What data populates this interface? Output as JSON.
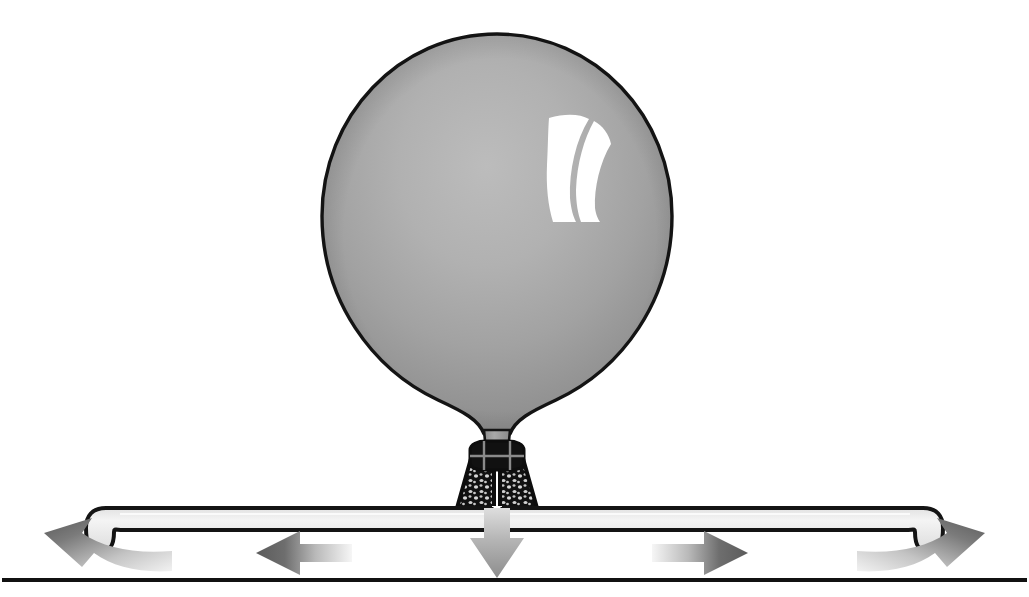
{
  "figure": {
    "title": "Inflated balloon tied to a flexible bar with force arrows",
    "domain_kind": "scientific-illustration",
    "canvas": {
      "width": 1029,
      "height": 597
    },
    "background_color": "#ffffff"
  },
  "balloon": {
    "label": "balloon",
    "center_x": 497,
    "center_y": 215,
    "radius_x": 175,
    "radius_y": 182,
    "top_y": 34,
    "bottom_y": 430,
    "left_x": 322,
    "right_x": 672,
    "fill_light": "#b4b4b4",
    "fill_mid": "#9a9a9a",
    "fill_dark": "#7d7d7d",
    "outline_color": "#141414",
    "outline_width": 3,
    "highlight_color": "#ffffff"
  },
  "highlight": {
    "label": "specular-highlight",
    "description": "two white crescent streaks on upper right of balloon",
    "center_x": 572,
    "center_y": 168,
    "color": "#ffffff"
  },
  "neck": {
    "label": "balloon-neck",
    "top_y": 400,
    "bottom_y": 440,
    "width": 26,
    "fill": "#9a9a9a"
  },
  "knot": {
    "label": "tied-knot",
    "description": "dark stippled knot clamping the balloon neck to the bar",
    "top_y": 448,
    "bottom_y": 510,
    "top_width": 48,
    "bottom_width": 78,
    "color": "#111111",
    "speckle_color": "#d8d8d8"
  },
  "bar": {
    "label": "flexible-bar",
    "left_x": 88,
    "right_x": 941,
    "top_y": 508,
    "bottom_y": 530,
    "thickness": 22,
    "end_drop": 32,
    "fill": "#ededed",
    "outline_color": "#141414",
    "outline_width": 4
  },
  "ground": {
    "label": "ground-line",
    "y": 580,
    "left_x": 4,
    "right_x": 1025,
    "color": "#111111",
    "thickness": 4
  },
  "arrows": [
    {
      "id": "left-curved-arrow",
      "name": "left-reaction-arrow",
      "kind": "curved",
      "direction": "up-left",
      "tip_x": 44,
      "tip_y": 540,
      "tail_x": 170,
      "tail_y": 568,
      "color_head": "#5e5e5e",
      "color_tail": "#e8e8e8"
    },
    {
      "id": "left-straight-arrow",
      "name": "left-force-arrow",
      "kind": "straight",
      "direction": "left",
      "tip_x": 256,
      "tip_y": 553,
      "tail_x": 350,
      "tail_y": 553,
      "color_head": "#6a6a6a",
      "color_tail": "#ececec"
    },
    {
      "id": "center-down-arrow",
      "name": "center-downward-force-arrow",
      "kind": "straight",
      "direction": "down",
      "tip_x": 497,
      "tip_y": 578,
      "tail_x": 497,
      "tail_y": 512,
      "color_head": "#8e8e8e",
      "color_tail": "#e2e2e2"
    },
    {
      "id": "right-straight-arrow",
      "name": "right-force-arrow",
      "kind": "straight",
      "direction": "right",
      "tip_x": 748,
      "tip_y": 553,
      "tail_x": 654,
      "tail_y": 553,
      "color_head": "#6a6a6a",
      "color_tail": "#ececec"
    },
    {
      "id": "right-curved-arrow",
      "name": "right-reaction-arrow",
      "kind": "curved",
      "direction": "up-right",
      "tip_x": 985,
      "tip_y": 540,
      "tail_x": 859,
      "tail_y": 568,
      "color_head": "#5e5e5e",
      "color_tail": "#e8e8e8"
    }
  ],
  "palette": {
    "ink": "#111111",
    "balloon_gray": "#9a9a9a",
    "bar_gray": "#ededed",
    "arrow_gray": "#6a6a6a",
    "white": "#ffffff"
  }
}
